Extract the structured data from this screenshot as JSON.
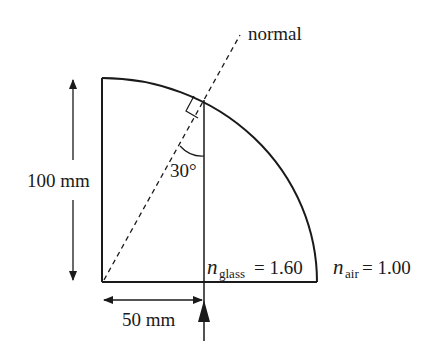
{
  "diagram": {
    "type": "optics-quarter-cylinder",
    "labels": {
      "normal": "normal",
      "angle": "30°",
      "height": "100 mm",
      "offset": "50 mm",
      "n_glass_symbol": "n",
      "n_glass_sub": "glass",
      "n_glass_value": "= 1.60",
      "n_air_symbol": "n",
      "n_air_sub": "air",
      "n_air_value": "= 1.00"
    },
    "colors": {
      "stroke": "#1a1a1a",
      "background": "#ffffff"
    }
  }
}
